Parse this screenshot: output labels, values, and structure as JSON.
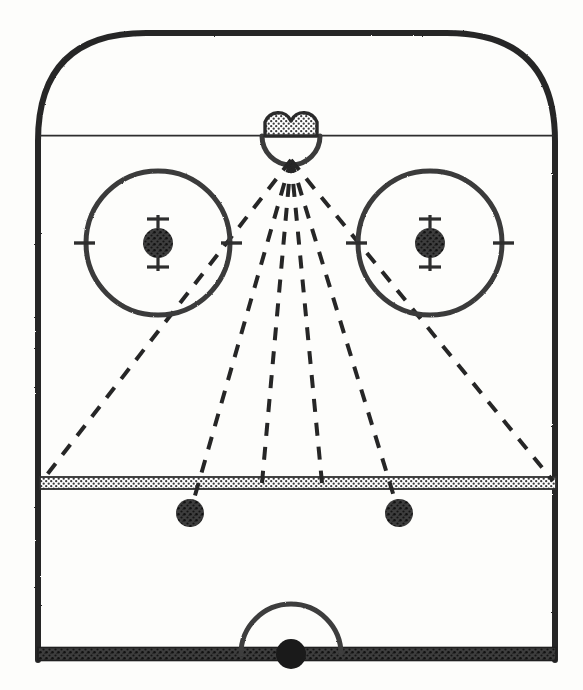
{
  "diagram": {
    "canvas": {
      "width": 583,
      "height": 690
    },
    "colors": {
      "ink": "#2b2b2b",
      "line_fill": "#6e6e6e",
      "dot_fill": "#4a4a4a",
      "net_fill": "#8c8c8c",
      "paper": "#fdfdfb"
    }
  },
  "rink": {
    "boards": {
      "name": "rink-boards",
      "left_x": 38,
      "right_x": 555,
      "top_y": 33,
      "bottom_y": 660,
      "corner_radius": 108,
      "stroke_width": 6
    },
    "goal_line": {
      "name": "goal-line",
      "y": 134,
      "x1": 40,
      "x2": 554,
      "stroke_width": 4,
      "label": "goal line"
    },
    "blue_line": {
      "name": "blue-line",
      "y": 483,
      "x1": 40,
      "x2": 556,
      "thickness": 12,
      "label": "blue line"
    },
    "center_line": {
      "name": "center-red-line",
      "y": 654,
      "x1": 38,
      "x2": 556,
      "thickness": 13,
      "label": "center red line"
    }
  },
  "goal": {
    "name": "goal-net",
    "label": "net",
    "center_x": 291,
    "lobe_radius": 14,
    "left_lobe_cx": 279,
    "right_lobe_cx": 303,
    "lobe_cy": 122,
    "base_y": 136
  },
  "crease": {
    "name": "goal-crease",
    "label": "crease",
    "center_x": 291,
    "center_y": 136,
    "radius": 29,
    "stroke_width": 5
  },
  "faceoff_circles": [
    {
      "name": "faceoff-circle-left",
      "label": "left faceoff circle",
      "cx": 158,
      "cy": 243,
      "radius": 72,
      "stroke_width": 5,
      "dot_radius": 15,
      "hash_len": 22
    },
    {
      "name": "faceoff-circle-right",
      "label": "right faceoff circle",
      "cx": 430,
      "cy": 243,
      "radius": 72,
      "stroke_width": 5,
      "dot_radius": 15,
      "hash_len": 22
    }
  ],
  "neutral_dots": [
    {
      "name": "neutral-zone-dot-left",
      "label": "left neutral zone dot",
      "cx": 190,
      "cy": 513,
      "r": 14
    },
    {
      "name": "neutral-zone-dot-right",
      "label": "right neutral zone dot",
      "cx": 399,
      "cy": 513,
      "r": 14
    }
  ],
  "center_ice": {
    "name": "center-ice-circle",
    "label": "center ice circle",
    "cx": 291,
    "cy": 654,
    "radius": 50,
    "stroke_width": 5,
    "dot": {
      "name": "center-ice-dot",
      "cx": 291,
      "cy": 654,
      "r": 15
    }
  },
  "angle_lines": {
    "name": "shooting-angle-lines",
    "label": "shooting angle lines",
    "origin": {
      "x": 291,
      "y": 160
    },
    "dash": "13 11",
    "stroke_width": 4,
    "rays": [
      {
        "name": "angle-ray-far-left",
        "label": "far left angle",
        "x2": 42,
        "y2": 481
      },
      {
        "name": "angle-ray-left",
        "label": "left angle",
        "x2": 190,
        "y2": 513
      },
      {
        "name": "angle-ray-center-left",
        "label": "center left angle",
        "x2": 262,
        "y2": 483
      },
      {
        "name": "angle-ray-center",
        "label": "center angle",
        "x2": 291,
        "y2": 660
      },
      {
        "name": "angle-ray-center-right",
        "label": "center right angle",
        "x2": 322,
        "y2": 483
      },
      {
        "name": "angle-ray-right",
        "label": "right angle",
        "x2": 399,
        "y2": 513
      },
      {
        "name": "angle-ray-far-right",
        "label": "far right angle",
        "x2": 553,
        "y2": 481
      }
    ]
  }
}
